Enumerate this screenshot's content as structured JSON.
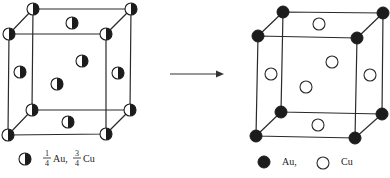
{
  "diagram": {
    "left_cube": {
      "name": "disordered",
      "atom_type": "half-filled",
      "legend": {
        "symbol": "half-filled-circle",
        "au_fraction_num": "1",
        "au_fraction_den": "4",
        "au_label": "Au,",
        "cu_fraction_num": "3",
        "cu_fraction_den": "4",
        "cu_label": "Cu"
      }
    },
    "arrow": {
      "direction": "right"
    },
    "right_cube": {
      "name": "ordered",
      "corner_atoms": "Au",
      "face_center_atoms": "Cu",
      "legend": {
        "au_symbol": "filled-circle",
        "au_label": "Au,",
        "cu_symbol": "open-circle",
        "cu_label": "Cu"
      }
    },
    "colors": {
      "line": "#2a2a2a",
      "fill": "#1c1c1c",
      "background": "#ffffff"
    }
  }
}
